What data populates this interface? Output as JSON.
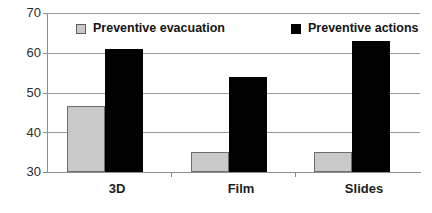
{
  "chart_data": {
    "type": "bar",
    "title": "",
    "subtitle": "",
    "xlabel": "",
    "ylabel": "",
    "categories": [
      "3D",
      "Film",
      "Slides"
    ],
    "series": [
      {
        "name": "Preventive evacuation",
        "color": "#c9c9c9",
        "values": [
          46.5,
          35,
          35
        ]
      },
      {
        "name": "Preventive actions",
        "color": "#000000",
        "values": [
          61,
          54,
          63
        ]
      }
    ],
    "ylim": [
      30,
      70
    ],
    "yticks": [
      30,
      40,
      50,
      60,
      70
    ],
    "ytick_labels": [
      "30",
      "40",
      "50",
      "60",
      "70"
    ],
    "grid": true,
    "legend_position": "top-inside"
  },
  "legend": {
    "entries": [
      {
        "label": "Preventive evacuation",
        "marker": "square-gray"
      },
      {
        "label": "Preventive actions",
        "marker": "square-black"
      }
    ]
  }
}
